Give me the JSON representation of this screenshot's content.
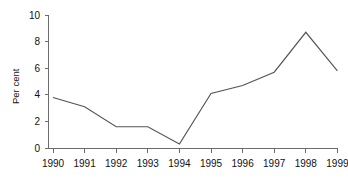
{
  "chart_data": {
    "type": "line",
    "title": "",
    "xlabel": "",
    "ylabel": "Per cent",
    "categories": [
      "1990",
      "1991",
      "1992",
      "1993",
      "1994",
      "1995",
      "1996",
      "1997",
      "1998",
      "1999"
    ],
    "values": [
      3.8,
      3.1,
      1.6,
      1.6,
      0.3,
      4.1,
      4.7,
      5.7,
      8.7,
      5.8
    ],
    "series": [
      {
        "name": "Per cent",
        "values": [
          3.8,
          3.1,
          1.6,
          1.6,
          0.3,
          4.1,
          4.7,
          5.7,
          8.7,
          5.8
        ],
        "color": "#555555"
      }
    ],
    "ylim": [
      0,
      10
    ],
    "yticks": [
      0,
      2,
      4,
      6,
      8,
      10
    ],
    "ytick_labels": [
      "0",
      "2",
      "4",
      "6",
      "8",
      "10"
    ],
    "xticks": [
      "1990",
      "1991",
      "1992",
      "1993",
      "1994",
      "1995",
      "1996",
      "1997",
      "1998",
      "1999"
    ],
    "grid": false,
    "legend": false,
    "legend_position": "none",
    "markers": false,
    "line_color": "#555555",
    "axis_color": "#6b6b6b",
    "text_color": "#111111",
    "background_color": "#ffffff"
  }
}
